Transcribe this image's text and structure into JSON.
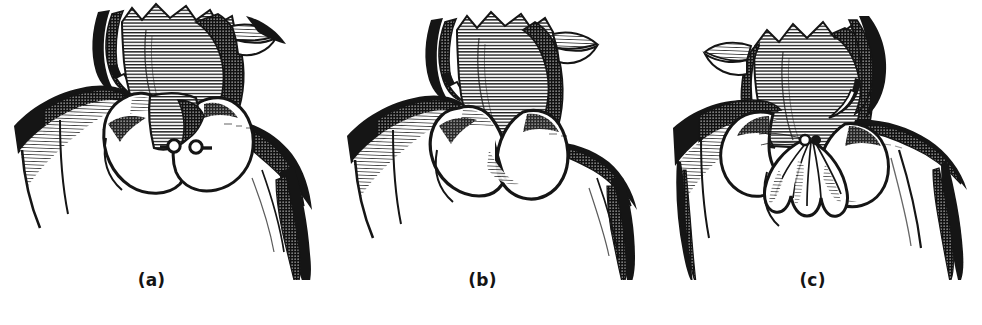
{
  "plate": {
    "title": "Collar style variations",
    "background_color": "#ffffff",
    "ink_color": "#151515",
    "mid_tone_color": "#8a8a8a",
    "figure_count": 3
  },
  "figures": [
    {
      "id": "a",
      "caption": "(a)",
      "name": "pointed-lapel-collar-with-button-loops",
      "description": "Shoulders and neck wearing a wide rounded collar with pointed lapel panel and two small button-and-loop fastenings at center front",
      "details": [
        "pointed lapel",
        "rounded collar edge",
        "two button loops",
        "shaded shoulder seams"
      ]
    },
    {
      "id": "b",
      "caption": "(b)",
      "name": "peter-pan-round-collar",
      "description": "Shoulders and neck wearing a flat rounded Peter Pan collar with two scalloped fronts meeting at the center",
      "details": [
        "flat round collar",
        "scalloped front edges",
        "standing neckband"
      ]
    },
    {
      "id": "c",
      "caption": "(c)",
      "name": "ruffled-jabot-collar",
      "description": "Shoulders and neck wearing a round collar with a gathered ruffled jabot at the center front",
      "details": [
        "round collar",
        "pleated jabot ruffle",
        "center gather knot"
      ]
    }
  ],
  "icons": {
    "button_loop": "button-loop-icon",
    "pleat": "pleat-icon"
  }
}
